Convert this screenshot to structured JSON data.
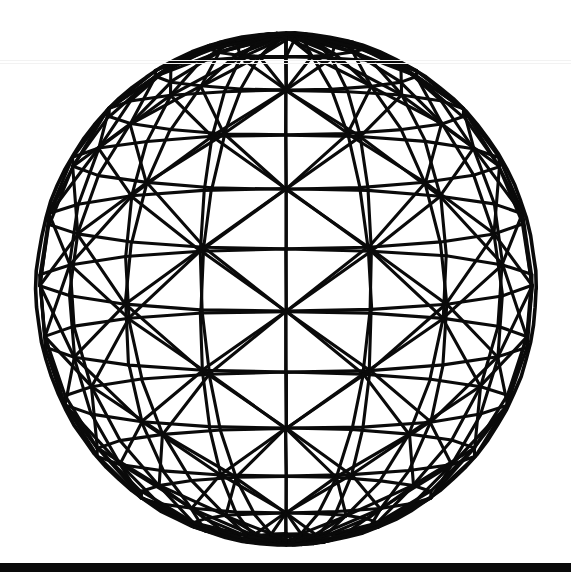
{
  "figure": {
    "style": "black line art on white",
    "line_color": "#0a0a0a",
    "background_color": "#ffffff",
    "artifact_color": "#f2f2f2",
    "stroke_width_px": 3.1,
    "stroke_width_outline_px": 3.6
  },
  "canvas": {
    "width": 571,
    "height": 578
  },
  "sphere": {
    "center_x": 286,
    "center_y": 289,
    "radius_x": 250,
    "radius_y": 256,
    "top_apex_x": 293,
    "top_apex_y": 33,
    "bottom_apex_x": 283,
    "bottom_apex_y": 545,
    "left_edge_x": 36,
    "right_edge_x": 536,
    "meridian_count": 18,
    "latitude_ring_count": 13,
    "tilt_degrees": -7,
    "mesh_type": "triangulated",
    "latitudes_deg": [
      72,
      58,
      44,
      30,
      16,
      2,
      -12,
      -26,
      -40,
      -54,
      -68,
      -80
    ],
    "bracing": "alternating diagonals between adjacent latitude rings forming triangles"
  },
  "baseline_rule": {
    "y_top": 563,
    "height": 9,
    "color": "#0a0a0a",
    "full_width": true
  },
  "scan_artifacts": [
    {
      "y": 60,
      "color": "#f2f2f2"
    },
    {
      "y": 63,
      "color": "#f5f5f5"
    }
  ],
  "chart_data": {
    "type": "scatter",
    "xlabel": "",
    "ylabel": "",
    "series": [
      {
        "name": "latitude-rings",
        "values": [
          72,
          58,
          44,
          30,
          16,
          2,
          -12,
          -26,
          -40,
          -54,
          -68,
          -80
        ]
      },
      {
        "name": "meridians",
        "values": [
          0,
          20,
          40,
          60,
          80,
          100,
          120,
          140,
          160,
          180,
          200,
          220,
          240,
          260,
          280,
          300,
          320,
          340
        ]
      }
    ]
  }
}
